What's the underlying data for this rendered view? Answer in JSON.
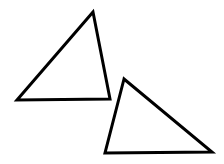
{
  "diagram": {
    "background": "#ffffff",
    "stroke_color": "#000000",
    "stroke_width": 3,
    "shapes": [
      {
        "type": "triangle",
        "label": "triangle-1",
        "points": [
          [
            93,
            12
          ],
          [
            17,
            100
          ],
          [
            110,
            99
          ]
        ]
      },
      {
        "type": "triangle",
        "label": "triangle-2",
        "points": [
          [
            124,
            79
          ],
          [
            105,
            153
          ],
          [
            212,
            152
          ]
        ]
      }
    ]
  }
}
